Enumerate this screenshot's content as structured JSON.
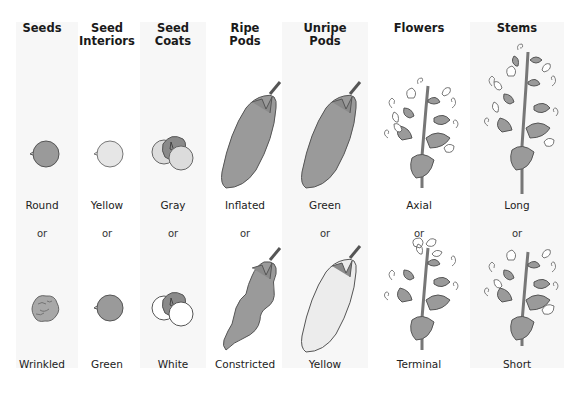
{
  "figure": {
    "colors": {
      "green": "#9a9a9a",
      "yellow": "#e6e6e6",
      "white": "#ffffff",
      "outline": "#555555",
      "band": "#f7f7f7"
    },
    "separator": "or",
    "traits": [
      {
        "header": "Seeds",
        "dominant": "Round",
        "recessive": "Wrinkled"
      },
      {
        "header": "Seed Interiors",
        "dominant": "Yellow",
        "recessive": "Green"
      },
      {
        "header": "Seed Coats",
        "dominant": "Gray",
        "recessive": "White"
      },
      {
        "header": "Ripe Pods",
        "dominant": "Inflated",
        "recessive": "Constricted"
      },
      {
        "header": "Unripe Pods",
        "dominant": "Green",
        "recessive": "Yellow"
      },
      {
        "header": "Flowers",
        "dominant": "Axial",
        "recessive": "Terminal"
      },
      {
        "header": "Stems",
        "dominant": "Long",
        "recessive": "Short"
      }
    ]
  }
}
